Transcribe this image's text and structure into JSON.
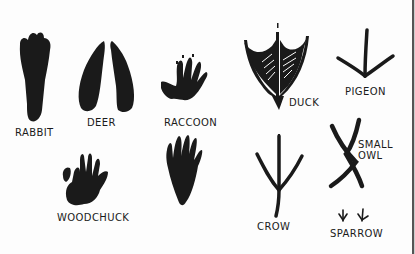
{
  "figure": {
    "ink_color": "#1a1a1a",
    "paper_color": "#fdfdfd"
  },
  "tracks": [
    {
      "id": "rabbit",
      "label": "RABBIT"
    },
    {
      "id": "deer",
      "label": "DEER"
    },
    {
      "id": "raccoon",
      "label": "RACCOON"
    },
    {
      "id": "duck",
      "label": "DUCK"
    },
    {
      "id": "pigeon",
      "label": "PIGEON"
    },
    {
      "id": "woodchuck",
      "label": "WOODCHUCK"
    },
    {
      "id": "raccoon-hind",
      "label": ""
    },
    {
      "id": "crow",
      "label": "CROW"
    },
    {
      "id": "small-owl",
      "label": "SMALL\nOWL"
    },
    {
      "id": "sparrow",
      "label": "SPARROW"
    }
  ]
}
